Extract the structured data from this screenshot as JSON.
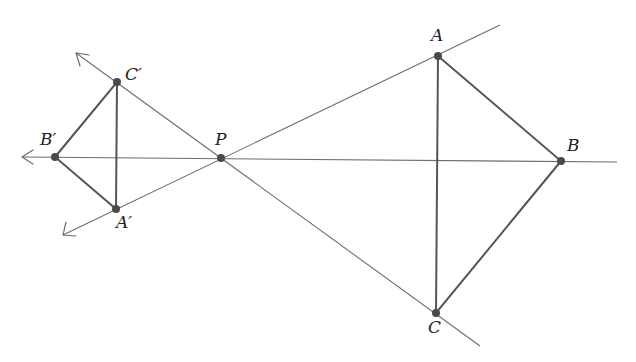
{
  "diagram": {
    "colors": {
      "construction_line": "#6e6e6e",
      "triangle_edge": "#555555",
      "point": "#4a4a4a",
      "label": "#222222",
      "background": "#ffffff"
    },
    "points": {
      "P": {
        "label": "P",
        "x": 221,
        "y": 158
      },
      "A": {
        "label": "A",
        "x": 438,
        "y": 56
      },
      "B": {
        "label": "B",
        "x": 561,
        "y": 161
      },
      "C": {
        "label": "C",
        "x": 436,
        "y": 313
      },
      "A1": {
        "label": "A′",
        "x": 116,
        "y": 209
      },
      "B1": {
        "label": "B′",
        "x": 55,
        "y": 157
      },
      "C1": {
        "label": "C′",
        "x": 117,
        "y": 82
      }
    },
    "construction_lines": [
      {
        "name": "line-AP",
        "from": "A",
        "through": "P",
        "to": "A1",
        "end_right": [
          500,
          25
        ],
        "arrow_left": [
          63,
          235
        ]
      },
      {
        "name": "line-BP",
        "from": "B",
        "through": "P",
        "to": "B1",
        "end_right": [
          617,
          162
        ],
        "arrow_left": [
          22,
          157
        ]
      },
      {
        "name": "line-CP",
        "from": "C",
        "through": "P",
        "to": "C1",
        "end_right": [
          480,
          346
        ],
        "arrow_left": [
          76,
          53
        ]
      }
    ],
    "triangles": [
      {
        "name": "triangle-ABC",
        "vertices": [
          "A",
          "B",
          "C"
        ]
      },
      {
        "name": "triangle-A'B'C'",
        "vertices": [
          "A′",
          "B′",
          "C′"
        ]
      }
    ],
    "labels": {
      "P": "P",
      "A": "A",
      "B": "B",
      "C": "C",
      "A_prime": "A′",
      "B_prime": "B′",
      "C_prime": "C′"
    }
  }
}
